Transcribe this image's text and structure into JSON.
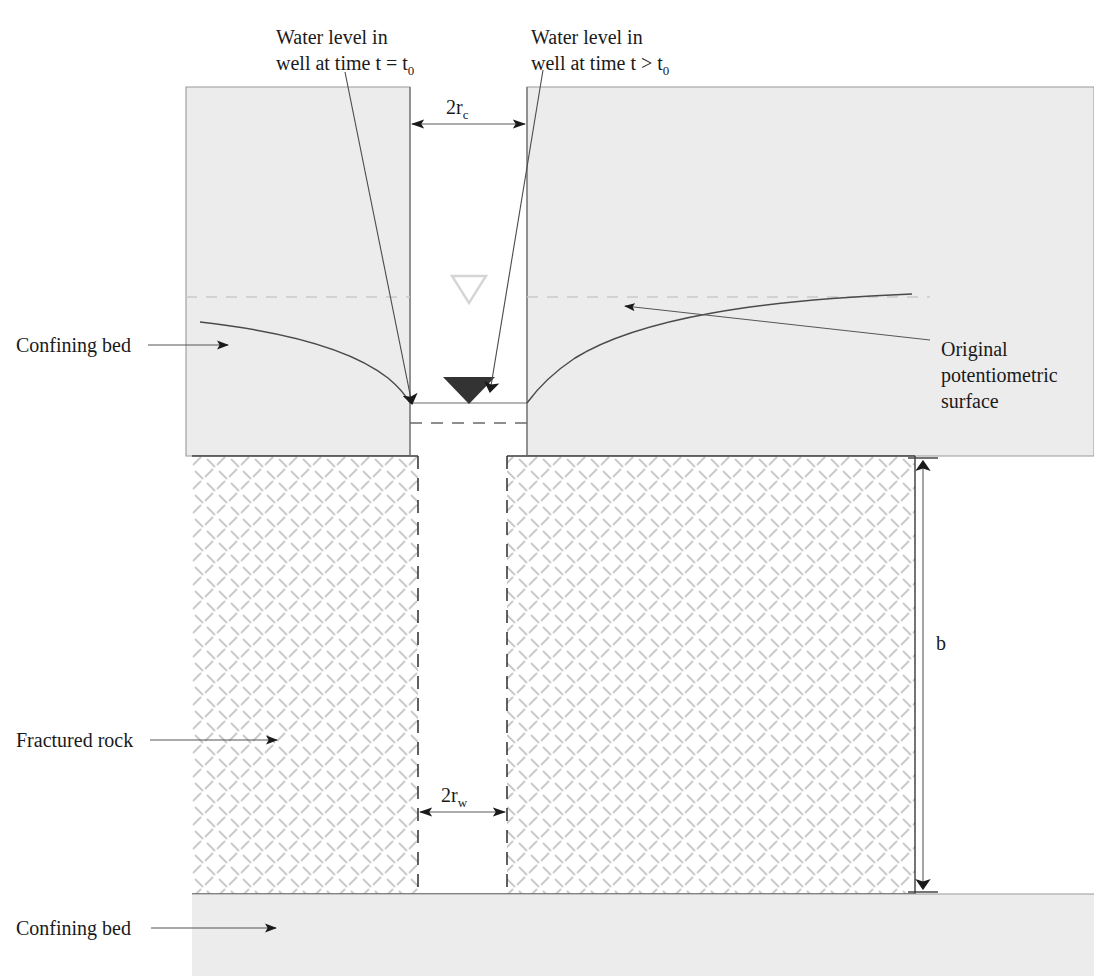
{
  "figure": {
    "type": "hydrogeology-cross-section"
  },
  "labels": {
    "water_level_initial": {
      "line1": "Water level in",
      "line2": "well at time t = t",
      "sub": "0"
    },
    "water_level_later": {
      "line1": "Water level in",
      "line2": "well at time t > t",
      "sub": "0"
    },
    "original_potentiometric": {
      "line1": "Original",
      "line2": "potentiometric",
      "line3": "surface"
    },
    "confining_bed_top": "Confining bed",
    "confining_bed_bottom": "Confining bed",
    "fractured_rock": "Fractured rock"
  },
  "dimensions": {
    "casing_diameter": {
      "main": "2r",
      "sub": "c"
    },
    "well_diameter": {
      "main": "2r",
      "sub": "w"
    },
    "aquifer_thickness": "b"
  },
  "colors": {
    "confining_bed_fill": "#ececec",
    "confining_bed_stroke": "#9a9a9a",
    "hatch_stroke": "#c8c8c8",
    "line_dark": "#3a3a3a",
    "line_mid": "#5a5a5a",
    "triangle_dark": "#333333",
    "triangle_light_stroke": "#d5d5d5",
    "potentiometric_dash": "#c9c9c9",
    "text": "#1a1a1a",
    "background": "#ffffff"
  }
}
